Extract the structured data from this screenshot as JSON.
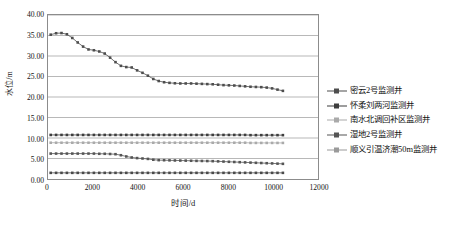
{
  "chart_data": {
    "type": "line",
    "title": "",
    "xlabel": "时间/d",
    "ylabel": "水位/m",
    "xlim": [
      0,
      12000
    ],
    "ylim": [
      0,
      40
    ],
    "xticks": [
      0,
      2000,
      4000,
      6000,
      8000,
      10000,
      12000
    ],
    "xtick_labels": [
      "0",
      "2000",
      "4000",
      "6000",
      "8000",
      "10000",
      "12000"
    ],
    "yticks": [
      0,
      5,
      10,
      15,
      20,
      25,
      30,
      35,
      40
    ],
    "ytick_labels": [
      "0.00",
      "5.00",
      "10.00",
      "15.00",
      "20.00",
      "25.00",
      "30.00",
      "35.00",
      "40.00"
    ],
    "grid": "horizontal",
    "legend_position": "right",
    "series": [
      {
        "name": "密云2号监测井",
        "color": "#4d4d4d",
        "marker": "square",
        "x": [
          120,
          360,
          600,
          840,
          1080,
          1320,
          1560,
          1800,
          2040,
          2280,
          2520,
          2760,
          3000,
          3240,
          3480,
          3720,
          3960,
          4200,
          4440,
          4680,
          4920,
          5160,
          5400,
          5640,
          5880,
          6120,
          6360,
          6600,
          6840,
          7080,
          7320,
          7560,
          7800,
          8040,
          8280,
          8520,
          8760,
          9000,
          9240,
          9480,
          9720,
          9960,
          10200,
          10440
        ],
        "values": [
          35.2,
          35.55,
          35.6,
          35.3,
          34.4,
          33.3,
          32.3,
          31.6,
          31.4,
          31.1,
          30.6,
          29.6,
          28.5,
          27.6,
          27.3,
          27.2,
          26.5,
          25.9,
          25.2,
          24.4,
          23.9,
          23.6,
          23.45,
          23.35,
          23.3,
          23.3,
          23.3,
          23.25,
          23.2,
          23.15,
          23.1,
          23.0,
          22.9,
          22.85,
          22.8,
          22.7,
          22.6,
          22.5,
          22.45,
          22.4,
          22.3,
          22.1,
          21.8,
          21.5
        ]
      },
      {
        "name": "怀柔刘两河监测井",
        "color": "#3d3d3d",
        "marker": "square",
        "x": [
          120,
          360,
          600,
          840,
          1080,
          1320,
          1560,
          1800,
          2040,
          2280,
          2520,
          2760,
          3000,
          3240,
          3480,
          3720,
          3960,
          4200,
          4440,
          4680,
          4920,
          5160,
          5400,
          5640,
          5880,
          6120,
          6360,
          6600,
          6840,
          7080,
          7320,
          7560,
          7800,
          8040,
          8280,
          8520,
          8760,
          9000,
          9240,
          9480,
          9720,
          9960,
          10200,
          10440
        ],
        "values": [
          10.75,
          10.75,
          10.75,
          10.75,
          10.75,
          10.75,
          10.75,
          10.75,
          10.75,
          10.75,
          10.75,
          10.75,
          10.75,
          10.75,
          10.75,
          10.75,
          10.75,
          10.75,
          10.75,
          10.75,
          10.75,
          10.75,
          10.75,
          10.75,
          10.75,
          10.75,
          10.75,
          10.75,
          10.75,
          10.75,
          10.75,
          10.75,
          10.75,
          10.75,
          10.75,
          10.75,
          10.75,
          10.7,
          10.7,
          10.7,
          10.7,
          10.7,
          10.7,
          10.7
        ]
      },
      {
        "name": "南水北调回补区监测井",
        "color": "#aaaaaa",
        "marker": "square",
        "x": [
          120,
          360,
          600,
          840,
          1080,
          1320,
          1560,
          1800,
          2040,
          2280,
          2520,
          2760,
          3000,
          3240,
          3480,
          3720,
          3960,
          4200,
          4440,
          4680,
          4920,
          5160,
          5400,
          5640,
          5880,
          6120,
          6360,
          6600,
          6840,
          7080,
          7320,
          7560,
          7800,
          8040,
          8280,
          8520,
          8760,
          9000,
          9240,
          9480,
          9720,
          9960,
          10200,
          10440
        ],
        "values": [
          8.85,
          8.85,
          8.85,
          8.85,
          8.85,
          8.85,
          8.85,
          8.85,
          8.85,
          8.85,
          8.85,
          8.85,
          8.85,
          8.85,
          8.85,
          8.85,
          8.85,
          8.85,
          8.85,
          8.85,
          8.85,
          8.85,
          8.85,
          8.85,
          8.85,
          8.85,
          8.85,
          8.85,
          8.85,
          8.85,
          8.85,
          8.85,
          8.85,
          8.85,
          8.85,
          8.85,
          8.85,
          8.8,
          8.8,
          8.8,
          8.8,
          8.8,
          8.8,
          8.8
        ]
      },
      {
        "name": "湿地2号监测井",
        "color": "#555555",
        "marker": "square",
        "x": [
          120,
          360,
          600,
          840,
          1080,
          1320,
          1560,
          1800,
          2040,
          2280,
          2520,
          2760,
          3000,
          3240,
          3480,
          3720,
          3960,
          4200,
          4440,
          4680,
          4920,
          5160,
          5400,
          5640,
          5880,
          6120,
          6360,
          6600,
          6840,
          7080,
          7320,
          7560,
          7800,
          8040,
          8280,
          8520,
          8760,
          9000,
          9240,
          9480,
          9720,
          9960,
          10200,
          10440
        ],
        "values": [
          6.2,
          6.2,
          6.2,
          6.2,
          6.2,
          6.2,
          6.2,
          6.2,
          6.2,
          6.15,
          6.15,
          6.1,
          6.05,
          5.8,
          5.5,
          5.25,
          5.1,
          5.0,
          4.9,
          4.7,
          4.6,
          4.58,
          4.55,
          4.52,
          4.5,
          4.48,
          4.45,
          4.42,
          4.4,
          4.38,
          4.35,
          4.3,
          4.25,
          4.2,
          4.15,
          4.1,
          4.05,
          4.0,
          3.95,
          3.9,
          3.85,
          3.8,
          3.75,
          3.7
        ]
      },
      {
        "name": "顺义引温济潮50m监测井",
        "color": "#4a4a4a",
        "marker": "square",
        "x": [
          120,
          360,
          600,
          840,
          1080,
          1320,
          1560,
          1800,
          2040,
          2280,
          2520,
          2760,
          3000,
          3240,
          3480,
          3720,
          3960,
          4200,
          4440,
          4680,
          4920,
          5160,
          5400,
          5640,
          5880,
          6120,
          6360,
          6600,
          6840,
          7080,
          7320,
          7560,
          7800,
          8040,
          8280,
          8520,
          8760,
          9000,
          9240,
          9480,
          9720,
          9960,
          10200,
          10440
        ],
        "values": [
          1.5,
          1.5,
          1.5,
          1.5,
          1.5,
          1.5,
          1.5,
          1.5,
          1.5,
          1.5,
          1.5,
          1.5,
          1.5,
          1.5,
          1.5,
          1.5,
          1.5,
          1.5,
          1.5,
          1.5,
          1.5,
          1.5,
          1.5,
          1.5,
          1.5,
          1.5,
          1.5,
          1.5,
          1.5,
          1.5,
          1.5,
          1.5,
          1.5,
          1.5,
          1.5,
          1.5,
          1.5,
          1.5,
          1.5,
          1.5,
          1.5,
          1.5,
          1.5,
          1.5
        ]
      }
    ]
  },
  "legend": {
    "items": [
      {
        "label": "密云2号监测井",
        "color": "#4d4d4d"
      },
      {
        "label": "怀柔刘两河监测井",
        "color": "#3d3d3d"
      },
      {
        "label": "南水北调回补区监测井",
        "color": "#aaaaaa"
      },
      {
        "label": "湿地2号监测井",
        "color": "#555555"
      },
      {
        "label": "顺义引温济潮50m监测井",
        "color": "#9a9a9a"
      }
    ]
  },
  "axes": {
    "x_title": "时间/d",
    "y_title": "水位/m"
  },
  "colors": {
    "frame": "#8c8c8c",
    "grid": "#9a9a9a",
    "text": "#111111",
    "background": "#ffffff"
  }
}
